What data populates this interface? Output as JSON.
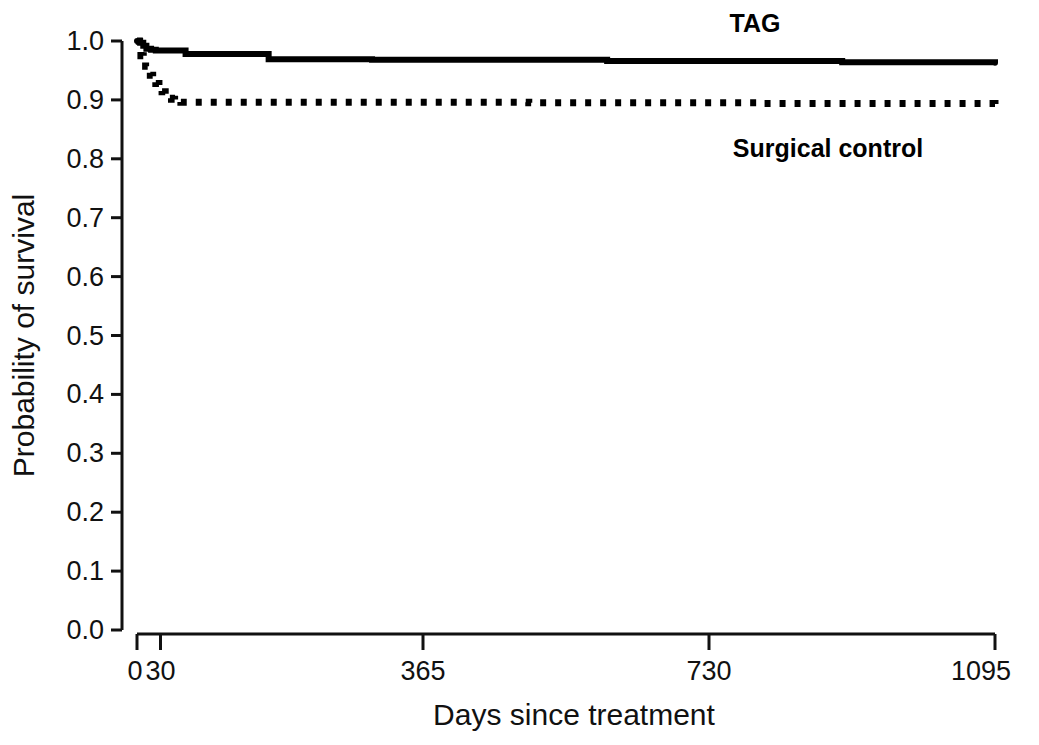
{
  "chart_data": {
    "type": "line",
    "title": "",
    "xlabel": "Days since treatment",
    "ylabel": "Probability of survival",
    "xlim": [
      0,
      1095
    ],
    "ylim": [
      0.0,
      1.0
    ],
    "grid": false,
    "legend_position": "inside-right",
    "xticks": [
      0,
      30,
      365,
      730,
      1095
    ],
    "xtick_labels": [
      "0",
      "30",
      "365",
      "730",
      "1095"
    ],
    "yticks": [
      0.0,
      0.1,
      0.2,
      0.3,
      0.4,
      0.5,
      0.6,
      0.7,
      0.8,
      0.9,
      1.0
    ],
    "ytick_labels": [
      "0.0",
      "0.1",
      "0.2",
      "0.3",
      "0.4",
      "0.5",
      "0.6",
      "0.7",
      "0.8",
      "0.9",
      "1.0"
    ],
    "series": [
      {
        "name": "TAG",
        "style": "solid",
        "color": "#000000",
        "label_text": "TAG",
        "x": [
          0,
          4,
          8,
          12,
          18,
          24,
          30,
          45,
          60,
          62,
          120,
          165,
          168,
          300,
          600,
          900,
          1095
        ],
        "values": [
          1.0,
          0.997,
          0.992,
          0.987,
          0.985,
          0.984,
          0.984,
          0.984,
          0.984,
          0.978,
          0.978,
          0.978,
          0.969,
          0.968,
          0.966,
          0.964,
          0.963
        ]
      },
      {
        "name": "Surgical control",
        "style": "dotted",
        "color": "#000000",
        "label_text": "Surgical control",
        "x": [
          0,
          3,
          5,
          8,
          11,
          14,
          17,
          20,
          24,
          28,
          32,
          36,
          40,
          44,
          48,
          52,
          56,
          200,
          500,
          800,
          1095
        ],
        "values": [
          1.0,
          0.985,
          0.975,
          0.966,
          0.957,
          0.949,
          0.942,
          0.936,
          0.928,
          0.922,
          0.914,
          0.907,
          0.903,
          0.901,
          0.899,
          0.897,
          0.896,
          0.896,
          0.895,
          0.894,
          0.893
        ]
      }
    ]
  }
}
